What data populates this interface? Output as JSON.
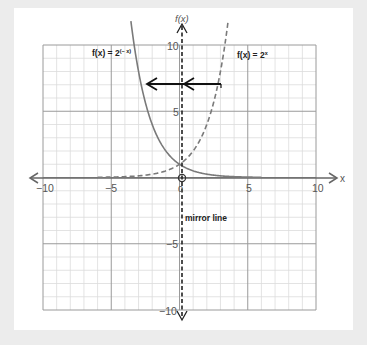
{
  "chart_data": {
    "type": "line",
    "title": "",
    "xlabel": "x",
    "ylabel": "f(x)",
    "xlim": [
      -10,
      10
    ],
    "ylim": [
      -10,
      10
    ],
    "grid": true,
    "x_ticks": [
      "-10",
      "-5",
      "0",
      "5",
      "10"
    ],
    "y_ticks": [
      "10",
      "5",
      "-5",
      "-10"
    ],
    "series": [
      {
        "name": "f(x) = 2^x",
        "style": "dashed",
        "formula": "2^x",
        "x": [
          -10,
          -5,
          -3,
          -2,
          -1,
          0,
          1,
          2,
          3,
          3.46
        ],
        "y": [
          0.001,
          0.031,
          0.125,
          0.25,
          0.5,
          1,
          2,
          4,
          8,
          11
        ]
      },
      {
        "name": "f(x) = 2^(-x)",
        "style": "solid",
        "formula": "2^(-x)",
        "x": [
          -3.46,
          -3,
          -2,
          -1,
          0,
          1,
          2,
          3,
          5,
          10
        ],
        "y": [
          11,
          8,
          4,
          2,
          1,
          0.5,
          0.25,
          0.125,
          0.031,
          0.001
        ]
      }
    ],
    "annotations": [
      {
        "text": "mirror line",
        "x": 0,
        "y": -2.3
      },
      {
        "type": "arrow",
        "from": [
          2.8,
          7
        ],
        "to": [
          -2.8,
          7
        ],
        "label": "reflection in y-axis"
      }
    ]
  },
  "labels": {
    "fx_axis": "f(x)",
    "x_axis": "x",
    "origin": "0",
    "curve_neg": "f(x) = 2",
    "curve_neg_exp": "(− x)",
    "curve_pos": "f(x) = 2",
    "curve_pos_exp": "x",
    "mirror": "mirror line",
    "tick_x_m10": "−10",
    "tick_x_m5": "−5",
    "tick_x_5": "5",
    "tick_x_10": "10",
    "tick_y_10": "10",
    "tick_y_5": "5",
    "tick_y_m5": "−5",
    "tick_y_m10": "−10"
  },
  "colors": {
    "background": "#ececec",
    "card": "#ffffff",
    "grid_minor": "#dcdcdc",
    "grid_major": "#9a9a9a",
    "curve": "#7a7a7a",
    "axis": "#666666",
    "mirror": "#222222"
  }
}
